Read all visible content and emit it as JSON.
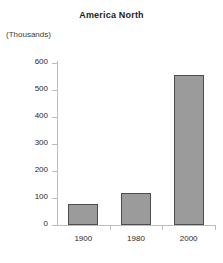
{
  "chart_data": {
    "type": "bar",
    "title": "America North",
    "unit_label": "(Thousands)",
    "xlabel": "",
    "ylabel": "",
    "categories": [
      "1900",
      "1980",
      "2000"
    ],
    "values": [
      78,
      119,
      555
    ],
    "series": [
      {
        "name": "America North",
        "values": [
          78,
          119,
          555
        ]
      }
    ],
    "ylim": [
      0,
      600
    ],
    "yticks": [
      0,
      100,
      200,
      300,
      400,
      500,
      600
    ],
    "ytick_labels": [
      "0",
      "100",
      "200",
      "300",
      "400",
      "500",
      "600"
    ],
    "grid": false,
    "legend": false,
    "bar_color": "#9b9b9b",
    "bar_border_color": "#4d4d4d",
    "axis_color": "#bdbdbd",
    "text_color": "#2a2a2a",
    "background": "#ffffff"
  }
}
